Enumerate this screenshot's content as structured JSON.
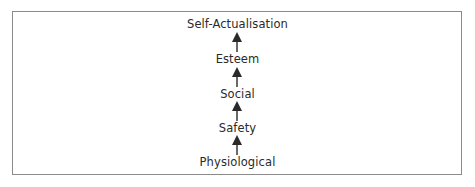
{
  "diagram": {
    "type": "hierarchy-flow",
    "direction": "bottom-to-top",
    "levels": [
      {
        "label": "Self-Actualisation"
      },
      {
        "label": "Esteem"
      },
      {
        "label": "Social"
      },
      {
        "label": "Safety"
      },
      {
        "label": "Physiological"
      }
    ],
    "arrows": [
      {
        "from": "Esteem",
        "to": "Self-Actualisation",
        "icon": "arrow-up-icon"
      },
      {
        "from": "Social",
        "to": "Esteem",
        "icon": "arrow-up-icon"
      },
      {
        "from": "Safety",
        "to": "Social",
        "icon": "arrow-up-icon"
      },
      {
        "from": "Physiological",
        "to": "Safety",
        "icon": "arrow-up-icon"
      }
    ],
    "colors": {
      "text": "#2a2a2a",
      "arrow": "#2a2a2a",
      "border": "#8a8a8a",
      "background": "#ffffff"
    }
  }
}
